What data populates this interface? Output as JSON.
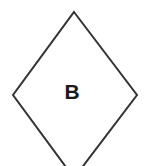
{
  "canvas": {
    "width": 144,
    "height": 166,
    "background_color": "#ffffff"
  },
  "diagram": {
    "type": "flowchart-node",
    "shape_name": "diamond",
    "shape_role": "decision-node",
    "label": "B",
    "stroke_color": "#333333",
    "fill_color": "#ffffff",
    "stroke_width": 2,
    "label_color": "#1a1a1a",
    "label_font_size": 21,
    "clipped_edge": "bottom",
    "geometry": {
      "top_vertex": {
        "x": 74,
        "y": 12
      },
      "right_vertex": {
        "x": 137,
        "y": 95
      },
      "bottom_vertex": {
        "x": 74,
        "y": 178
      },
      "left_vertex": {
        "x": 13,
        "y": 95
      },
      "label_center": {
        "x": 72,
        "y": 91
      },
      "points": "74,12 137,95 74,178 13,95"
    }
  }
}
